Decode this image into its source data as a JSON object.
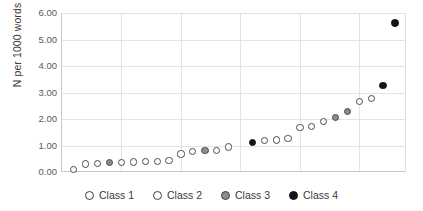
{
  "chart_data": {
    "type": "scatter",
    "title": "",
    "xlabel": "",
    "ylabel": "N per 1000 words",
    "ylim": [
      0,
      6
    ],
    "ytick_labels": [
      "6.00",
      "5.00",
      "4.00",
      "3.00",
      "2.00",
      "1.00",
      "0.00"
    ],
    "ytick_values": [
      6,
      5,
      4,
      3,
      2,
      1,
      0
    ],
    "xlim": [
      0,
      29
    ],
    "x_axis_visible_ticks": false,
    "grid": "horizontal-and-vertical",
    "legend_position": "bottom-center",
    "legend": [
      {
        "label": "Class 1",
        "marker": "open-circle",
        "fill": "#ffffff",
        "stroke": "#4a4a4a"
      },
      {
        "label": "Class 2",
        "marker": "open-circle",
        "fill": "#ffffff",
        "stroke": "#4a4a4a"
      },
      {
        "label": "Class 3",
        "marker": "filled-circle",
        "fill": "#8c8c8c",
        "stroke": "#4a4a4a"
      },
      {
        "label": "Class 4",
        "marker": "filled-circle",
        "fill": "#141414",
        "stroke": "#141414"
      }
    ],
    "series": [
      {
        "name": "Class 1",
        "points": [
          {
            "x": 1,
            "y": 0.08
          },
          {
            "x": 2,
            "y": 0.3
          },
          {
            "x": 3,
            "y": 0.32
          },
          {
            "x": 5,
            "y": 0.37
          },
          {
            "x": 6,
            "y": 0.38
          },
          {
            "x": 7,
            "y": 0.4
          },
          {
            "x": 8,
            "y": 0.41
          },
          {
            "x": 9,
            "y": 0.42
          },
          {
            "x": 10,
            "y": 0.68
          },
          {
            "x": 11,
            "y": 0.76
          }
        ]
      },
      {
        "name": "Class 2",
        "points": [
          {
            "x": 13,
            "y": 0.82
          },
          {
            "x": 14,
            "y": 0.94
          },
          {
            "x": 17,
            "y": 1.2
          },
          {
            "x": 18,
            "y": 1.21
          },
          {
            "x": 19,
            "y": 1.27
          },
          {
            "x": 20,
            "y": 1.69
          },
          {
            "x": 21,
            "y": 1.73
          },
          {
            "x": 22,
            "y": 1.91
          },
          {
            "x": 25,
            "y": 2.67
          },
          {
            "x": 26,
            "y": 2.78
          }
        ]
      },
      {
        "name": "Class 3",
        "points": [
          {
            "x": 4,
            "y": 0.36
          },
          {
            "x": 12,
            "y": 0.81
          },
          {
            "x": 23,
            "y": 2.06
          },
          {
            "x": 24,
            "y": 2.28
          }
        ]
      },
      {
        "name": "Class 4",
        "points": [
          {
            "x": 16,
            "y": 1.11
          },
          {
            "x": 27,
            "y": 3.27
          },
          {
            "x": 28,
            "y": 5.62
          }
        ]
      }
    ]
  },
  "legend": {
    "items": [
      {
        "label": "Class 1",
        "cls": "c1"
      },
      {
        "label": "Class 2",
        "cls": "c2"
      },
      {
        "label": "Class 3",
        "cls": "c3"
      },
      {
        "label": "Class 4",
        "cls": "c4"
      }
    ]
  }
}
